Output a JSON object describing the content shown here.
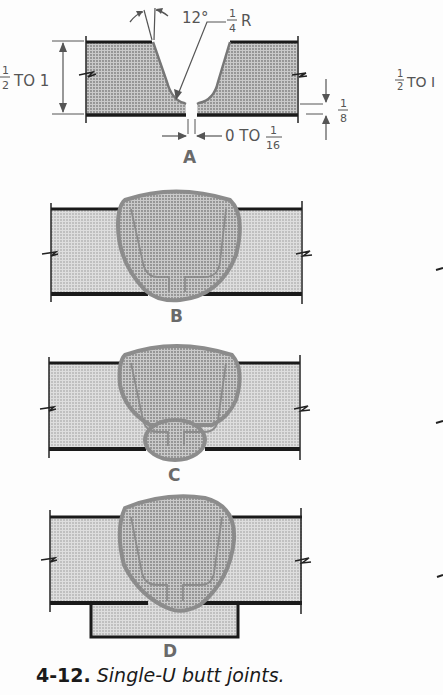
{
  "figure": {
    "number": "4-12.",
    "title": "Single-U butt joints."
  },
  "panels": [
    {
      "id": "A",
      "label": "A",
      "description": "Joint preparation with dimensions"
    },
    {
      "id": "B",
      "label": "B",
      "description": "Weld from one side"
    },
    {
      "id": "C",
      "label": "C",
      "description": "Weld with back (sealing) bead"
    },
    {
      "id": "D",
      "label": "D",
      "description": "Weld with backing strip"
    }
  ],
  "dimensions": {
    "thickness": {
      "whole": "",
      "num": "1",
      "den": "2",
      "suffix": "TO 1"
    },
    "groove_angle": "12°",
    "root_radius": {
      "num": "1",
      "den": "4",
      "suffix": "R"
    },
    "root_face": {
      "num": "1",
      "den": "8"
    },
    "root_opening": {
      "prefix": "0 TO",
      "num": "1",
      "den": "16"
    },
    "right_thickness": {
      "num": "1",
      "den": "2",
      "suffix": "TO I"
    }
  },
  "colors": {
    "plate_fill": "#d4d4d4",
    "weld_outline": "#8c8c8c",
    "weld_fill": "#bdbdbd",
    "plate_edge": "#1a1a1a",
    "dim_line": "#555555"
  }
}
